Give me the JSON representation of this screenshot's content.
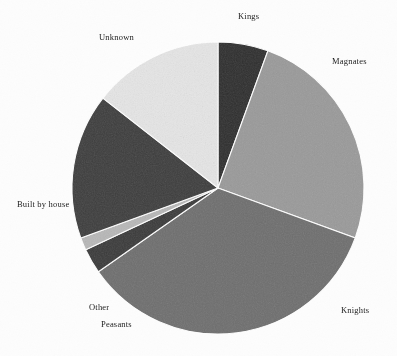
{
  "figure": {
    "background_color": "#fdfdfd",
    "label_color": "#1c1c1c"
  },
  "chart_data": {
    "type": "pie",
    "title": "",
    "subtitle": "",
    "xlabel": "",
    "ylabel": "",
    "legend_position": "none",
    "labels_position": "outside",
    "grid": false,
    "start_angle_deg_from_top": 0,
    "direction": "clockwise",
    "center_px": [
      218,
      188
    ],
    "radius_px": 146,
    "categories": [
      "Kings",
      "Magnates",
      "Knights",
      "Peasants",
      "Other",
      "Built by house",
      "Unknown"
    ],
    "values": [
      5.6,
      25.0,
      34.7,
      2.8,
      1.4,
      16.1,
      14.4
    ],
    "angles_deg": [
      20,
      90,
      125,
      10,
      5,
      58,
      52
    ],
    "colors": [
      "#2e2e2e",
      "#9a9a9a",
      "#6e6e6e",
      "#3a3a3a",
      "#b8b8b8",
      "#3d3d3d",
      "#e6e6e6"
    ],
    "slices": [
      {
        "label": "Kings",
        "value": 5.6,
        "angle_deg": 20,
        "color": "#2e2e2e",
        "start_deg": 0,
        "end_deg": 20
      },
      {
        "label": "Magnates",
        "value": 25.0,
        "angle_deg": 90,
        "color": "#9a9a9a",
        "start_deg": 20,
        "end_deg": 110
      },
      {
        "label": "Knights",
        "value": 34.7,
        "angle_deg": 125,
        "color": "#6e6e6e",
        "start_deg": 110,
        "end_deg": 235
      },
      {
        "label": "Peasants",
        "value": 2.8,
        "angle_deg": 10,
        "color": "#3a3a3a",
        "start_deg": 235,
        "end_deg": 245
      },
      {
        "label": "Other",
        "value": 1.4,
        "angle_deg": 5,
        "color": "#b8b8b8",
        "start_deg": 245,
        "end_deg": 250
      },
      {
        "label": "Built by house",
        "value": 16.1,
        "angle_deg": 58,
        "color": "#3d3d3d",
        "start_deg": 250,
        "end_deg": 308
      },
      {
        "label": "Unknown",
        "value": 14.4,
        "angle_deg": 52,
        "color": "#e6e6e6",
        "start_deg": 308,
        "end_deg": 360
      }
    ],
    "annotations": []
  },
  "labels": {
    "kings": "Kings",
    "magnates": "Magnates",
    "knights": "Knights",
    "peasants": "Peasants",
    "other": "Other",
    "built_by_house": "Built by house",
    "unknown": "Unknown"
  }
}
